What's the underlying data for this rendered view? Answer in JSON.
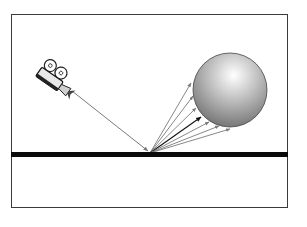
{
  "diagram": {
    "type": "ray-reflection-illustration",
    "colors": {
      "background": "#ffffff",
      "frame": "#3a3a3a",
      "ground": "#0a0a0a",
      "ray": "#7a7a7a",
      "highlight_ray": "#111111",
      "sphere_light": "#ffffff",
      "sphere_dark": "#6e6e6e",
      "sphere_outline": "#444444"
    },
    "elements": {
      "camera": {
        "label": "camera-icon",
        "x": 50,
        "y": 80
      },
      "incident_ray": {
        "from": [
          72,
          91
        ],
        "to": [
          150,
          152
        ]
      },
      "ground_line": {
        "y": 154,
        "x_start": 11,
        "x_end": 287
      },
      "sphere": {
        "cx": 230,
        "cy": 90,
        "r": 37
      },
      "reflected_rays": [
        {
          "to": [
            191,
            83
          ],
          "highlight": false
        },
        {
          "to": [
            193,
            96
          ],
          "highlight": false
        },
        {
          "to": [
            196,
            108
          ],
          "highlight": false
        },
        {
          "to": [
            201,
            117
          ],
          "highlight": true
        },
        {
          "to": [
            209,
            122
          ],
          "highlight": false
        },
        {
          "to": [
            219,
            126
          ],
          "highlight": false
        },
        {
          "to": [
            230,
            129
          ],
          "highlight": false
        }
      ]
    }
  }
}
